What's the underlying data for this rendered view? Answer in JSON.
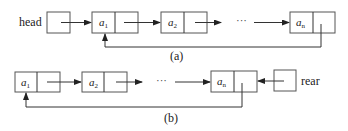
{
  "diagram_a": {
    "caption": "(a)",
    "pointer_label": "head",
    "nodes": [
      {
        "var": "a",
        "sub": "1"
      },
      {
        "var": "a",
        "sub": "2"
      },
      {
        "var": "a",
        "sub": "n"
      }
    ],
    "ellipsis": "···"
  },
  "diagram_b": {
    "caption": "(b)",
    "pointer_label": "rear",
    "nodes": [
      {
        "var": "a",
        "sub": "1"
      },
      {
        "var": "a",
        "sub": "2"
      },
      {
        "var": "a",
        "sub": "n"
      }
    ],
    "ellipsis": "···"
  },
  "colors": {
    "stroke": "#555555",
    "text": "#222222",
    "background": "#ffffff"
  }
}
